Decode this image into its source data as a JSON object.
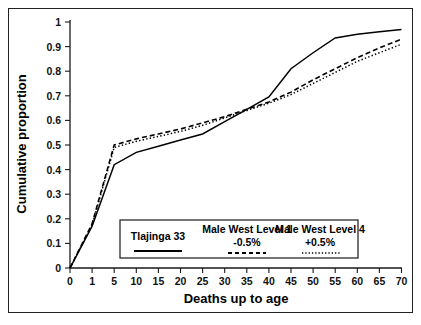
{
  "chart_data": {
    "type": "line",
    "title": "",
    "xlabel": "Deaths up to age",
    "ylabel": "Cumulative proportion",
    "grid": false,
    "legend_position": "bottom-center-inside",
    "x_categories": [
      "0",
      "1",
      "5",
      "10",
      "15",
      "20",
      "25",
      "30",
      "35",
      "40",
      "45",
      "50",
      "55",
      "60",
      "65",
      "70"
    ],
    "x_tick_values": [
      0,
      1,
      5,
      10,
      15,
      20,
      25,
      30,
      35,
      40,
      45,
      50,
      55,
      60,
      65,
      70
    ],
    "y_ticks": [
      "0",
      "0.1",
      "0.2",
      "0.3",
      "0.4",
      "0.5",
      "0.6",
      "0.7",
      "0.8",
      "0.9",
      "1"
    ],
    "y_tick_values": [
      0,
      0.1,
      0.2,
      0.3,
      0.4,
      0.5,
      0.6,
      0.7,
      0.8,
      0.9,
      1
    ],
    "ylim": [
      0,
      1
    ],
    "series": [
      {
        "name": "Tlajinga 33",
        "style": "solid",
        "values": [
          0.0,
          0.17,
          0.42,
          0.47,
          0.495,
          0.52,
          0.545,
          0.595,
          0.645,
          0.695,
          0.81,
          0.875,
          0.935,
          0.95,
          0.96,
          0.97
        ]
      },
      {
        "name": "Male West Level 1",
        "sublabel": "-0.5%",
        "style": "dashed",
        "values": [
          0.0,
          0.18,
          0.5,
          0.525,
          0.545,
          0.565,
          0.59,
          0.615,
          0.645,
          0.675,
          0.715,
          0.765,
          0.81,
          0.855,
          0.895,
          0.93
        ]
      },
      {
        "name": "Male West Level 4",
        "sublabel": "+0.5%",
        "style": "dotted",
        "values": [
          0.0,
          0.175,
          0.49,
          0.515,
          0.535,
          0.555,
          0.58,
          0.61,
          0.64,
          0.67,
          0.705,
          0.75,
          0.795,
          0.84,
          0.875,
          0.91
        ]
      }
    ],
    "legend": [
      {
        "label": "Tlajinga 33",
        "sublabel": "",
        "style": "solid"
      },
      {
        "label": "Male West Level 1",
        "sublabel": "-0.5%",
        "style": "dashed"
      },
      {
        "label": "Male West Level 4",
        "sublabel": "+0.5%",
        "style": "dotted"
      }
    ]
  }
}
